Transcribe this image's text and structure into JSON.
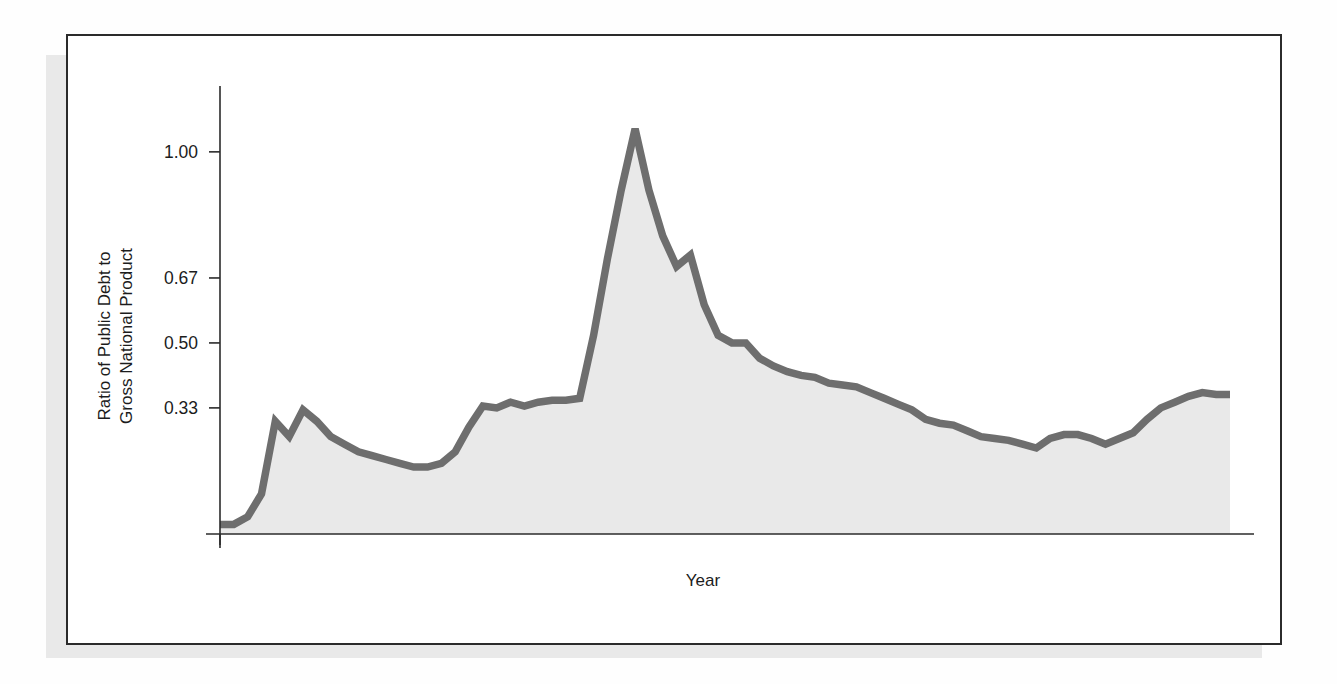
{
  "figure": {
    "xlabel": "Year",
    "ylabel_line1": "Ratio of Public Debt to",
    "ylabel_line2": "Gross National Product",
    "series_color": "#6e6e6e",
    "fill_color": "#e9e9e9",
    "frame_color": "#2b2b2b",
    "shadow_color": "#e9e9e9"
  },
  "yticks": [
    {
      "label": "1.00",
      "value": 1.0
    },
    {
      "label": "0.67",
      "value": 0.67
    },
    {
      "label": "0.50",
      "value": 0.5
    },
    {
      "label": "0.33",
      "value": 0.33
    }
  ],
  "xticks": [
    "1915",
    "1920",
    "1925",
    "1930",
    "1935",
    "1940",
    "1945",
    "1950",
    "1955",
    "1960",
    "1965",
    "1970",
    "1975",
    "1980",
    "1985"
  ],
  "annotations": [
    {
      "id": "world-war-1",
      "lines": [
        "World",
        "War I"
      ],
      "text": "World War I",
      "target_year": 1918
    },
    {
      "id": "great-depression",
      "lines": [
        "Great",
        "Depression"
      ],
      "text": "Great Depression",
      "target_year": 1931.5
    },
    {
      "id": "world-war-2",
      "lines": [
        "World",
        "War II"
      ],
      "text": "World War II",
      "target_year": 1943
    },
    {
      "id": "recession-1974-1975",
      "lines": [
        "1974–1975",
        "Recession"
      ],
      "text": "1974–1975 Recession",
      "target_year": 1974.5
    },
    {
      "id": "recession-1981-1982",
      "lines": [
        "1981–1982",
        "Recession"
      ],
      "text": "1981–1982 Recession",
      "target_year": 1981.5
    },
    {
      "id": "tax-cuts-1981-1984",
      "lines": [
        "1981–1984",
        "Tax Cuts"
      ],
      "text": "1981–1984 Tax Cuts",
      "target_year": 1981.8
    }
  ],
  "chart_data": {
    "type": "area",
    "title": "",
    "subtitle": "",
    "xlabel": "Year",
    "ylabel": "Ratio of Public Debt to Gross National Product",
    "grid": false,
    "legend": null,
    "xlim": [
      1915,
      1988
    ],
    "ylim": [
      0,
      1.12
    ],
    "ytick_values": [
      0.33,
      0.5,
      0.67,
      1.0
    ],
    "ytick_labels": [
      "0.33",
      "0.50",
      "0.67",
      "1.00"
    ],
    "xtick_values": [
      1915,
      1920,
      1925,
      1930,
      1935,
      1940,
      1945,
      1950,
      1955,
      1960,
      1965,
      1970,
      1975,
      1980,
      1985
    ],
    "x": [
      1915,
      1916,
      1917,
      1918,
      1919,
      1920,
      1921,
      1922,
      1923,
      1924,
      1925,
      1926,
      1927,
      1928,
      1929,
      1930,
      1931,
      1932,
      1933,
      1934,
      1935,
      1936,
      1937,
      1938,
      1939,
      1940,
      1941,
      1942,
      1943,
      1944,
      1945,
      1946,
      1947,
      1948,
      1949,
      1950,
      1951,
      1952,
      1953,
      1954,
      1955,
      1956,
      1957,
      1958,
      1959,
      1960,
      1961,
      1962,
      1963,
      1964,
      1965,
      1966,
      1967,
      1968,
      1969,
      1970,
      1971,
      1972,
      1973,
      1974,
      1975,
      1976,
      1977,
      1978,
      1979,
      1980,
      1981,
      1982,
      1983,
      1984,
      1985,
      1986,
      1987,
      1988
    ],
    "y": [
      0.025,
      0.025,
      0.045,
      0.105,
      0.295,
      0.255,
      0.325,
      0.295,
      0.255,
      0.235,
      0.215,
      0.205,
      0.195,
      0.185,
      0.175,
      0.175,
      0.185,
      0.215,
      0.28,
      0.335,
      0.33,
      0.345,
      0.335,
      0.345,
      0.35,
      0.35,
      0.355,
      0.52,
      0.72,
      0.9,
      1.06,
      0.9,
      0.78,
      0.7,
      0.73,
      0.6,
      0.52,
      0.5,
      0.5,
      0.46,
      0.44,
      0.425,
      0.415,
      0.41,
      0.395,
      0.39,
      0.385,
      0.37,
      0.355,
      0.34,
      0.325,
      0.3,
      0.29,
      0.285,
      0.27,
      0.255,
      0.25,
      0.245,
      0.235,
      0.225,
      0.25,
      0.26,
      0.26,
      0.25,
      0.235,
      0.25,
      0.265,
      0.3,
      0.33,
      0.345,
      0.36,
      0.37,
      0.365,
      0.365
    ],
    "series": [
      {
        "name": "Ratio of Public Debt to Gross National Product",
        "values": [
          0.025,
          0.025,
          0.045,
          0.105,
          0.295,
          0.255,
          0.325,
          0.295,
          0.255,
          0.235,
          0.215,
          0.205,
          0.195,
          0.185,
          0.175,
          0.175,
          0.185,
          0.215,
          0.28,
          0.335,
          0.33,
          0.345,
          0.335,
          0.345,
          0.35,
          0.35,
          0.355,
          0.52,
          0.72,
          0.9,
          1.06,
          0.9,
          0.78,
          0.7,
          0.73,
          0.6,
          0.52,
          0.5,
          0.5,
          0.46,
          0.44,
          0.425,
          0.415,
          0.41,
          0.395,
          0.39,
          0.385,
          0.37,
          0.355,
          0.34,
          0.325,
          0.3,
          0.29,
          0.285,
          0.27,
          0.255,
          0.25,
          0.245,
          0.235,
          0.225,
          0.25,
          0.26,
          0.26,
          0.25,
          0.235,
          0.25,
          0.265,
          0.3,
          0.33,
          0.345,
          0.36,
          0.37,
          0.365,
          0.365
        ]
      }
    ],
    "annotations": [
      {
        "label": "World War I",
        "year": 1918
      },
      {
        "label": "Great Depression",
        "year": 1931.5
      },
      {
        "label": "World War II",
        "year": 1943
      },
      {
        "label": "1974–1975 Recession",
        "year": 1974.5
      },
      {
        "label": "1981–1982 Recession",
        "year": 1981.5
      },
      {
        "label": "1981–1984 Tax Cuts",
        "year": 1981.8
      }
    ]
  }
}
